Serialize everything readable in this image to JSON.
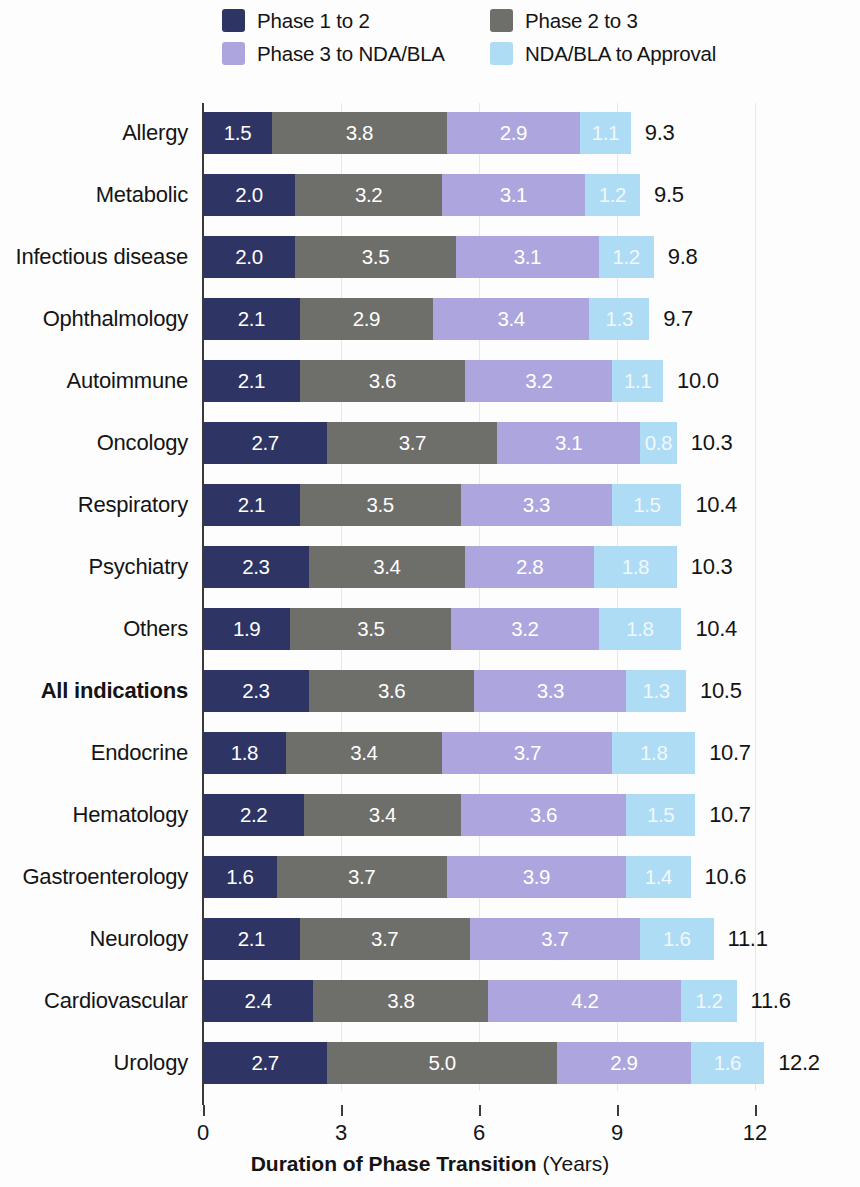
{
  "colors": {
    "phase1to2": "#2E3463",
    "phase2to3": "#6E6E6B",
    "phase3toNDA": "#ADA6DE",
    "NDAtoApproval": "#AFDCF5",
    "axis": "#3A3A3A",
    "grid": "#E8E8EA",
    "text": "#141414",
    "background": "#FDFDFD"
  },
  "legend": {
    "items": [
      {
        "label": "Phase 1 to 2",
        "color_key": "phase1to2"
      },
      {
        "label": "Phase 2 to 3",
        "color_key": "phase2to3"
      },
      {
        "label": "Phase 3 to NDA/BLA",
        "color_key": "phase3toNDA"
      },
      {
        "label": "NDA/BLA to Approval",
        "color_key": "NDAtoApproval"
      }
    ]
  },
  "axis": {
    "title_strong": "Duration of Phase Transition",
    "title_unit": " (Years)",
    "ticks": [
      "0",
      "3",
      "6",
      "9",
      "12"
    ],
    "tick_values": [
      0,
      3,
      6,
      9,
      12
    ],
    "xlim": [
      0,
      12
    ]
  },
  "chart_data": {
    "type": "bar",
    "subtype": "horizontal-stacked",
    "title": "",
    "xlabel": "Duration of Phase Transition (Years)",
    "ylabel": "",
    "xlim": [
      0,
      12
    ],
    "xticks": [
      0,
      3,
      6,
      9,
      12
    ],
    "grid": "vertical",
    "legend_position": "top",
    "series": [
      {
        "name": "Phase 1 to 2",
        "color": "#2E3463",
        "values": [
          1.5,
          2.0,
          2.0,
          2.1,
          2.1,
          2.7,
          2.1,
          2.3,
          1.9,
          2.3,
          1.8,
          2.2,
          1.6,
          2.1,
          2.4,
          2.7
        ]
      },
      {
        "name": "Phase 2 to 3",
        "color": "#6E6E6B",
        "values": [
          3.8,
          3.2,
          3.5,
          2.9,
          3.6,
          3.7,
          3.5,
          3.4,
          3.5,
          3.6,
          3.4,
          3.4,
          3.7,
          3.7,
          3.8,
          5.0
        ]
      },
      {
        "name": "Phase 3 to NDA/BLA",
        "color": "#ADA6DE",
        "values": [
          2.9,
          3.1,
          3.1,
          3.4,
          3.2,
          3.1,
          3.3,
          2.8,
          3.2,
          3.3,
          3.7,
          3.6,
          3.9,
          3.7,
          4.2,
          2.9
        ]
      },
      {
        "name": "NDA/BLA to Approval",
        "color": "#AFDCF5",
        "values": [
          1.1,
          1.2,
          1.2,
          1.3,
          1.1,
          0.8,
          1.5,
          1.8,
          1.8,
          1.3,
          1.8,
          1.5,
          1.4,
          1.6,
          1.2,
          1.6
        ]
      }
    ],
    "categories": [
      "Allergy",
      "Metabolic",
      "Infectious disease",
      "Ophthalmology",
      "Autoimmune",
      "Oncology",
      "Respiratory",
      "Psychiatry",
      "Others",
      "All indications",
      "Endocrine",
      "Hematology",
      "Gastroenterology",
      "Neurology",
      "Cardiovascular",
      "Urology"
    ],
    "totals": [
      9.3,
      9.5,
      9.8,
      9.7,
      10.0,
      10.3,
      10.4,
      10.3,
      10.4,
      10.5,
      10.7,
      10.7,
      10.6,
      11.1,
      11.6,
      12.2
    ],
    "total_labels": [
      "9.3",
      "9.5",
      "9.8",
      "9.7",
      "10.0",
      "10.3",
      "10.4",
      "10.3",
      "10.4",
      "10.5",
      "10.7",
      "10.7",
      "10.6",
      "11.1",
      "11.6",
      "12.2"
    ],
    "highlighted_category": "All indications"
  },
  "rows": [
    {
      "category": "Allergy",
      "bold": false,
      "segments": [
        "1.5",
        "3.8",
        "2.9",
        "1.1"
      ],
      "values": [
        1.5,
        3.8,
        2.9,
        1.1
      ],
      "total": "9.3"
    },
    {
      "category": "Metabolic",
      "bold": false,
      "segments": [
        "2.0",
        "3.2",
        "3.1",
        "1.2"
      ],
      "values": [
        2.0,
        3.2,
        3.1,
        1.2
      ],
      "total": "9.5"
    },
    {
      "category": "Infectious disease",
      "bold": false,
      "segments": [
        "2.0",
        "3.5",
        "3.1",
        "1.2"
      ],
      "values": [
        2.0,
        3.5,
        3.1,
        1.2
      ],
      "total": "9.8"
    },
    {
      "category": "Ophthalmology",
      "bold": false,
      "segments": [
        "2.1",
        "2.9",
        "3.4",
        "1.3"
      ],
      "values": [
        2.1,
        2.9,
        3.4,
        1.3
      ],
      "total": "9.7"
    },
    {
      "category": "Autoimmune",
      "bold": false,
      "segments": [
        "2.1",
        "3.6",
        "3.2",
        "1.1"
      ],
      "values": [
        2.1,
        3.6,
        3.2,
        1.1
      ],
      "total": "10.0"
    },
    {
      "category": "Oncology",
      "bold": false,
      "segments": [
        "2.7",
        "3.7",
        "3.1",
        "0.8"
      ],
      "values": [
        2.7,
        3.7,
        3.1,
        0.8
      ],
      "total": "10.3"
    },
    {
      "category": "Respiratory",
      "bold": false,
      "segments": [
        "2.1",
        "3.5",
        "3.3",
        "1.5"
      ],
      "values": [
        2.1,
        3.5,
        3.3,
        1.5
      ],
      "total": "10.4"
    },
    {
      "category": "Psychiatry",
      "bold": false,
      "segments": [
        "2.3",
        "3.4",
        "2.8",
        "1.8"
      ],
      "values": [
        2.3,
        3.4,
        2.8,
        1.8
      ],
      "total": "10.3"
    },
    {
      "category": "Others",
      "bold": false,
      "segments": [
        "1.9",
        "3.5",
        "3.2",
        "1.8"
      ],
      "values": [
        1.9,
        3.5,
        3.2,
        1.8
      ],
      "total": "10.4"
    },
    {
      "category": "All indications",
      "bold": true,
      "segments": [
        "2.3",
        "3.6",
        "3.3",
        "1.3"
      ],
      "values": [
        2.3,
        3.6,
        3.3,
        1.3
      ],
      "total": "10.5"
    },
    {
      "category": "Endocrine",
      "bold": false,
      "segments": [
        "1.8",
        "3.4",
        "3.7",
        "1.8"
      ],
      "values": [
        1.8,
        3.4,
        3.7,
        1.8
      ],
      "total": "10.7"
    },
    {
      "category": "Hematology",
      "bold": false,
      "segments": [
        "2.2",
        "3.4",
        "3.6",
        "1.5"
      ],
      "values": [
        2.2,
        3.4,
        3.6,
        1.5
      ],
      "total": "10.7"
    },
    {
      "category": "Gastroenterology",
      "bold": false,
      "segments": [
        "1.6",
        "3.7",
        "3.9",
        "1.4"
      ],
      "values": [
        1.6,
        3.7,
        3.9,
        1.4
      ],
      "total": "10.6"
    },
    {
      "category": "Neurology",
      "bold": false,
      "segments": [
        "2.1",
        "3.7",
        "3.7",
        "1.6"
      ],
      "values": [
        2.1,
        3.7,
        3.7,
        1.6
      ],
      "total": "11.1"
    },
    {
      "category": "Cardiovascular",
      "bold": false,
      "segments": [
        "2.4",
        "3.8",
        "4.2",
        "1.2"
      ],
      "values": [
        2.4,
        3.8,
        4.2,
        1.2
      ],
      "total": "11.6"
    },
    {
      "category": "Urology",
      "bold": false,
      "segments": [
        "2.7",
        "5.0",
        "2.9",
        "1.6"
      ],
      "values": [
        2.7,
        5.0,
        2.9,
        1.6
      ],
      "total": "12.2"
    }
  ]
}
